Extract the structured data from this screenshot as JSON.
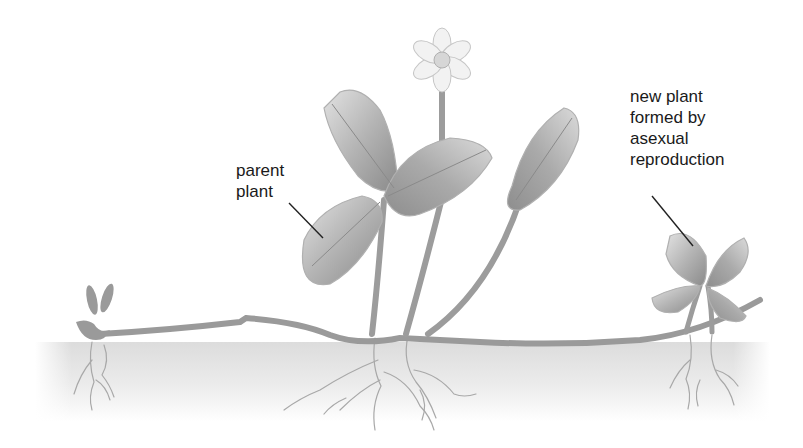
{
  "diagram": {
    "labels": {
      "parent_plant": "parent\nplant",
      "new_plant": "new plant\nformed by\nasexual\nreproduction"
    },
    "components": [
      "parent plant",
      "flower",
      "leaves",
      "stems",
      "runner (stolon)",
      "soil",
      "roots",
      "new plant",
      "sprouting plantlet"
    ],
    "colors": {
      "plant": "#9a9a9a",
      "leaf_light": "#d8d8d8",
      "leaf_dark": "#8c8c8c",
      "soil": "#e6e6e6",
      "roots": "#a8a8a8",
      "text": "#1a1a1a",
      "leader_line": "#222222"
    }
  }
}
